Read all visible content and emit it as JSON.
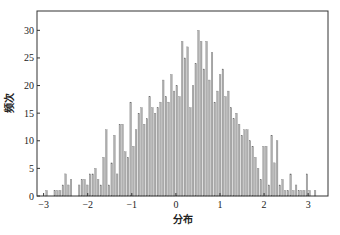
{
  "chart_data": {
    "type": "bar",
    "subtype": "histogram",
    "title": "",
    "xlabel": "分布",
    "ylabel": "频次",
    "xlim": [
      -3.15,
      3.45
    ],
    "ylim": [
      0,
      33.5
    ],
    "xticks": [
      -3,
      -2,
      -1,
      0,
      1,
      2,
      3
    ],
    "yticks": [
      0,
      5,
      10,
      15,
      20,
      25,
      30
    ],
    "grid": false,
    "legend": null,
    "bar_color": "#b0b0b0",
    "bar_edge_color": "#707070",
    "bins": 100,
    "bin_start": -2.95,
    "bin_width": 0.0615,
    "values": [
      1,
      0,
      0,
      1,
      1,
      1,
      2,
      4,
      2,
      3,
      0,
      0,
      2,
      3,
      3,
      2,
      4,
      4,
      5,
      3,
      2,
      7,
      12,
      2,
      6,
      11,
      4,
      13,
      13,
      8,
      7,
      17,
      9,
      12,
      15,
      16,
      13,
      14,
      18,
      16,
      15,
      16,
      17,
      21,
      18,
      17,
      22,
      19,
      20,
      18,
      28,
      25,
      27,
      16,
      20,
      24,
      30,
      28,
      23,
      28,
      21,
      26,
      17,
      19,
      22,
      23,
      18,
      19,
      16,
      14,
      15,
      13,
      11,
      12,
      12,
      10,
      9,
      7,
      5,
      3,
      9,
      9,
      2,
      11,
      6,
      10,
      2,
      3,
      1,
      1,
      4,
      1,
      2,
      1,
      1,
      1,
      4,
      1,
      0,
      1
    ],
    "x_tick_labels": [
      "−3",
      "−2",
      "−1",
      "0",
      "1",
      "2",
      "3"
    ],
    "y_tick_labels": [
      "0",
      "5",
      "10",
      "15",
      "20",
      "25",
      "30"
    ]
  }
}
